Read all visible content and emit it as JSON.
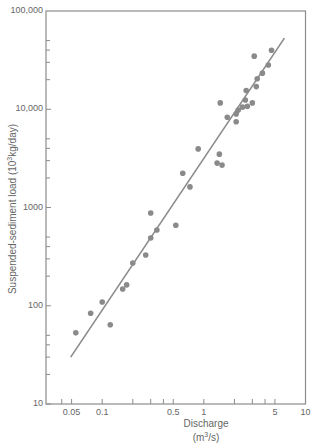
{
  "chart_data": {
    "type": "scatter",
    "title": "",
    "xlabel": "Discharge",
    "xlabel_units": "(m³/s)",
    "ylabel": "Suspended-sediment load (10³kg/day)",
    "xscale": "log",
    "yscale": "log",
    "xlim": [
      0.028,
      10
    ],
    "ylim": [
      10,
      100000
    ],
    "grid": false,
    "legend": null,
    "x_tick_labels": [
      "0.05",
      "0.1",
      "0.5",
      "1",
      "5",
      "10"
    ],
    "x_tick_values": [
      0.05,
      0.1,
      0.5,
      1,
      5,
      10
    ],
    "y_tick_labels": [
      "10",
      "100",
      "1000",
      "10,000",
      "100,000"
    ],
    "y_tick_values": [
      10,
      100,
      1000,
      10000,
      100000
    ],
    "series": [
      {
        "name": "observations",
        "kind": "scatter",
        "color": "#8a8a8a",
        "points": [
          [
            0.055,
            53
          ],
          [
            0.077,
            84
          ],
          [
            0.1,
            109
          ],
          [
            0.12,
            64
          ],
          [
            0.159,
            148
          ],
          [
            0.174,
            163
          ],
          [
            0.2,
            272
          ],
          [
            0.268,
            329
          ],
          [
            0.3,
            490
          ],
          [
            0.3,
            880
          ],
          [
            0.345,
            590
          ],
          [
            0.53,
            660
          ],
          [
            0.62,
            2230
          ],
          [
            0.73,
            1620
          ],
          [
            0.88,
            3950
          ],
          [
            1.42,
            3490
          ],
          [
            1.35,
            2830
          ],
          [
            1.51,
            2700
          ],
          [
            1.45,
            11600
          ],
          [
            1.7,
            8300
          ],
          [
            2.08,
            8950
          ],
          [
            2.08,
            7450
          ],
          [
            2.18,
            9800
          ],
          [
            2.4,
            10500
          ],
          [
            2.56,
            12400
          ],
          [
            2.68,
            10700
          ],
          [
            3.0,
            11600
          ],
          [
            2.61,
            15500
          ],
          [
            3.28,
            17000
          ],
          [
            3.35,
            20400
          ],
          [
            3.77,
            23300
          ],
          [
            4.31,
            28200
          ],
          [
            3.13,
            34700
          ],
          [
            4.63,
            39800
          ]
        ]
      },
      {
        "name": "regression line",
        "kind": "line",
        "color": "#8a8a8a",
        "points": [
          [
            0.049,
            30
          ],
          [
            6.2,
            53000
          ]
        ]
      }
    ]
  },
  "axis": {
    "x_label": "Discharge",
    "x_units_prefix": "(m",
    "x_units_sup": "3",
    "x_units_suffix": "/s)",
    "y_label_prefix": "Suspended-sediment load (10",
    "y_label_sup": "3",
    "y_label_suffix": "kg/day)"
  }
}
